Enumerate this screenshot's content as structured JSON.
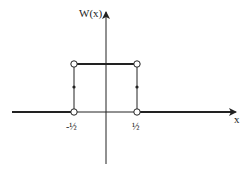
{
  "diagram": {
    "y_axis_label": "W(x)",
    "x_axis_label": "x",
    "tick_labels": [
      "-½",
      "½"
    ],
    "function": "rectangular window W(x): 1 for |x| < 1/2, 1/2 at x = ±1/2, 0 otherwise",
    "colors": {
      "line": "#222222",
      "background": "#ffffff"
    }
  }
}
